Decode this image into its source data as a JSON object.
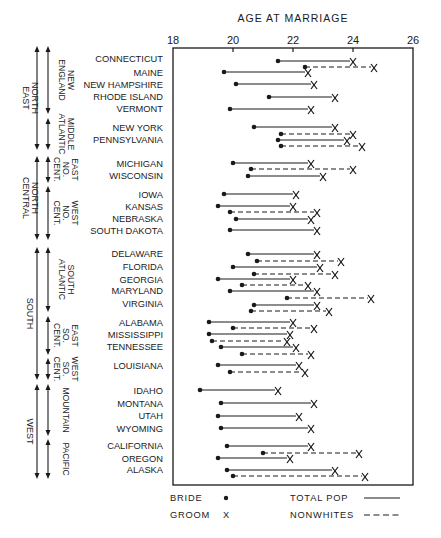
{
  "chart_data": {
    "type": "dumbbell",
    "title": "AGE AT MARRIAGE",
    "xlabel": "AGE AT MARRIAGE",
    "ylabel": "",
    "xlim": [
      18,
      26
    ],
    "xticks": [
      18,
      20,
      22,
      24,
      26
    ],
    "grid": false,
    "legend": {
      "position": "bottom",
      "entries": [
        {
          "label": "BRIDE",
          "symbol": "dot"
        },
        {
          "label": "GROOM",
          "symbol": "X"
        },
        {
          "label": "TOTAL POP",
          "symbol": "solid-line"
        },
        {
          "label": "NONWHITES",
          "symbol": "dashed-line"
        }
      ]
    },
    "regions": [
      {
        "label": "NORTH EAST",
        "y_top": 46,
        "y_bottom": 150,
        "divisions": [
          {
            "label": "NEW ENGLAND",
            "y_top": 46,
            "y_bottom": 114
          },
          {
            "label": "MIDDLE ATLANTIC",
            "y_top": 118,
            "y_bottom": 150
          }
        ]
      },
      {
        "label": "NORTH CENTRAL",
        "y_top": 156,
        "y_bottom": 240,
        "divisions": [
          {
            "label": "EAST NO. CENT.",
            "y_top": 156,
            "y_bottom": 183
          },
          {
            "label": "WEST NO. CENT.",
            "y_top": 186,
            "y_bottom": 240
          }
        ]
      },
      {
        "label": "SOUTH",
        "y_top": 247,
        "y_bottom": 380,
        "divisions": [
          {
            "label": "SOUTH ATLANTIC",
            "y_top": 247,
            "y_bottom": 312
          },
          {
            "label": "EAST SO. CENT.",
            "y_top": 316,
            "y_bottom": 355
          },
          {
            "label": "WEST SO. CENT.",
            "y_top": 358,
            "y_bottom": 380
          }
        ]
      },
      {
        "label": "WEST",
        "y_top": 384,
        "y_bottom": 479,
        "divisions": [
          {
            "label": "MOUNTAIN",
            "y_top": 384,
            "y_bottom": 436
          },
          {
            "label": "PACIFIC",
            "y_top": 439,
            "y_bottom": 479
          }
        ]
      }
    ],
    "states": [
      {
        "name": "CONNECTICUT",
        "y": 58,
        "total": {
          "bride": 21.5,
          "groom": 24.0,
          "y": 61
        },
        "nonwhite": {
          "bride": 22.4,
          "groom": 24.7,
          "y": 67
        }
      },
      {
        "name": "MAINE",
        "y": 72,
        "total": {
          "bride": 19.7,
          "groom": 22.5,
          "y": 72
        }
      },
      {
        "name": "NEW HAMPSHIRE",
        "y": 84,
        "total": {
          "bride": 20.1,
          "groom": 22.7,
          "y": 84
        }
      },
      {
        "name": "RHODE ISLAND",
        "y": 96,
        "total": {
          "bride": 21.2,
          "groom": 23.4,
          "y": 97
        }
      },
      {
        "name": "VERMONT",
        "y": 108,
        "total": {
          "bride": 19.9,
          "groom": 22.6,
          "y": 109
        }
      },
      {
        "name": "NEW YORK",
        "y": 127,
        "total": {
          "bride": 20.7,
          "groom": 23.4,
          "y": 127
        },
        "nonwhite": {
          "bride": 21.6,
          "groom": 24.0,
          "y": 134
        }
      },
      {
        "name": "PENNSYLVANIA",
        "y": 139,
        "total": {
          "bride": 21.5,
          "groom": 23.8,
          "y": 140
        },
        "nonwhite": {
          "bride": 21.6,
          "groom": 24.3,
          "y": 146
        }
      },
      {
        "name": "MICHIGAN",
        "y": 163,
        "total": {
          "bride": 20.0,
          "groom": 22.6,
          "y": 163
        },
        "nonwhite": {
          "bride": 20.6,
          "groom": 24.0,
          "y": 169
        }
      },
      {
        "name": "WISCONSIN",
        "y": 175,
        "total": {
          "bride": 20.5,
          "groom": 23.0,
          "y": 176
        }
      },
      {
        "name": "IOWA",
        "y": 194,
        "total": {
          "bride": 19.7,
          "groom": 22.1,
          "y": 194
        }
      },
      {
        "name": "KANSAS",
        "y": 206,
        "total": {
          "bride": 19.5,
          "groom": 22.0,
          "y": 206
        },
        "nonwhite": {
          "bride": 19.9,
          "groom": 22.8,
          "y": 212
        }
      },
      {
        "name": "NEBRASKA",
        "y": 218,
        "total": {
          "bride": 20.1,
          "groom": 22.6,
          "y": 219
        }
      },
      {
        "name": "SOUTH DAKOTA",
        "y": 230,
        "total": {
          "bride": 19.9,
          "groom": 22.8,
          "y": 230
        }
      },
      {
        "name": "DELAWARE",
        "y": 253,
        "total": {
          "bride": 20.5,
          "groom": 22.8,
          "y": 254
        },
        "nonwhite": {
          "bride": 20.8,
          "groom": 23.6,
          "y": 261
        }
      },
      {
        "name": "FLORIDA",
        "y": 266,
        "total": {
          "bride": 20.0,
          "groom": 22.9,
          "y": 267
        },
        "nonwhite": {
          "bride": 20.7,
          "groom": 23.4,
          "y": 274
        }
      },
      {
        "name": "GEORGIA",
        "y": 279,
        "total": {
          "bride": 19.5,
          "groom": 22.0,
          "y": 279
        },
        "nonwhite": {
          "bride": 20.3,
          "groom": 22.5,
          "y": 285
        }
      },
      {
        "name": "MARYLAND",
        "y": 290,
        "total": {
          "bride": 19.9,
          "groom": 22.8,
          "y": 291
        },
        "nonwhite": {
          "bride": 21.8,
          "groom": 24.6,
          "y": 298
        }
      },
      {
        "name": "VIRGINIA",
        "y": 303,
        "total": {
          "bride": 20.7,
          "groom": 22.8,
          "y": 305
        },
        "nonwhite": {
          "bride": 20.6,
          "groom": 23.2,
          "y": 311
        }
      },
      {
        "name": "ALABAMA",
        "y": 322,
        "total": {
          "bride": 19.2,
          "groom": 22.0,
          "y": 322
        },
        "nonwhite": {
          "bride": 20.0,
          "groom": 22.7,
          "y": 328
        }
      },
      {
        "name": "MISSISSIPPI",
        "y": 334,
        "total": {
          "bride": 19.2,
          "groom": 21.9,
          "y": 334
        },
        "nonwhite": {
          "bride": 19.3,
          "groom": 21.8,
          "y": 341
        }
      },
      {
        "name": "TENNESSEE",
        "y": 346,
        "total": {
          "bride": 19.6,
          "groom": 22.1,
          "y": 347
        },
        "nonwhite": {
          "bride": 20.3,
          "groom": 22.6,
          "y": 354
        }
      },
      {
        "name": "LOUISIANA",
        "y": 365,
        "total": {
          "bride": 19.5,
          "groom": 22.2,
          "y": 365
        },
        "nonwhite": {
          "bride": 19.9,
          "groom": 22.4,
          "y": 372
        }
      },
      {
        "name": "IDAHO",
        "y": 390,
        "total": {
          "bride": 18.9,
          "groom": 21.5,
          "y": 390
        }
      },
      {
        "name": "MONTANA",
        "y": 403,
        "total": {
          "bride": 19.6,
          "groom": 22.7,
          "y": 403
        }
      },
      {
        "name": "UTAH",
        "y": 415,
        "total": {
          "bride": 19.5,
          "groom": 22.2,
          "y": 416
        }
      },
      {
        "name": "WYOMING",
        "y": 428,
        "total": {
          "bride": 19.6,
          "groom": 22.6,
          "y": 428
        }
      },
      {
        "name": "CALIFORNIA",
        "y": 445,
        "total": {
          "bride": 19.8,
          "groom": 22.6,
          "y": 446
        },
        "nonwhite": {
          "bride": 21.0,
          "groom": 24.2,
          "y": 453
        }
      },
      {
        "name": "OREGON",
        "y": 458,
        "total": {
          "bride": 19.5,
          "groom": 21.9,
          "y": 458
        }
      },
      {
        "name": "ALASKA",
        "y": 469,
        "total": {
          "bride": 19.8,
          "groom": 23.4,
          "y": 470
        },
        "nonwhite": {
          "bride": 20.0,
          "groom": 24.4,
          "y": 476
        }
      }
    ]
  },
  "colors": {
    "ink": "#1a1a1a",
    "background": "#ffffff"
  }
}
